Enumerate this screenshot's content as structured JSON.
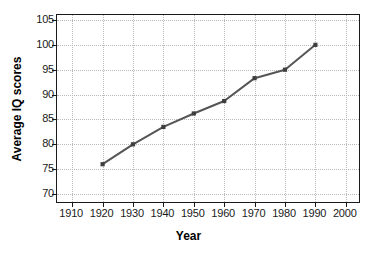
{
  "chart_data": {
    "type": "line",
    "title": "",
    "xlabel": "Year",
    "ylabel": "Average IQ scores",
    "xlim": [
      1905,
      2005
    ],
    "ylim": [
      68,
      106
    ],
    "grid": true,
    "legend": false,
    "x": [
      1920,
      1930,
      1940,
      1950,
      1960,
      1970,
      1980,
      1990
    ],
    "values": [
      76.0,
      80.0,
      83.5,
      86.2,
      88.7,
      93.3,
      95.0,
      100.0
    ],
    "series": [
      {
        "name": "Average IQ scores",
        "x": [
          1920,
          1930,
          1940,
          1950,
          1960,
          1970,
          1980,
          1990
        ],
        "values": [
          76.0,
          80.0,
          83.5,
          86.2,
          88.7,
          93.3,
          95.0,
          100.0
        ],
        "color": "#555555",
        "marker": "square"
      }
    ],
    "xticks": [
      1910,
      1920,
      1930,
      1940,
      1950,
      1960,
      1970,
      1980,
      1990,
      2000
    ],
    "xtick_labels": [
      "1910",
      "1920",
      "1930",
      "1940",
      "1950",
      "1960",
      "1970",
      "1980",
      "1990",
      "2000"
    ],
    "yticks": [
      70,
      75,
      80,
      85,
      90,
      95,
      100,
      105
    ],
    "ytick_labels": [
      "70",
      "75",
      "80",
      "85",
      "90",
      "95",
      "100",
      "105"
    ],
    "colors": {
      "line": "#555555",
      "marker": "#3f3f3f",
      "grid": "#b9b9b9",
      "frame": "#1a1a1a",
      "text": "#000000",
      "background": "#ffffff"
    }
  }
}
